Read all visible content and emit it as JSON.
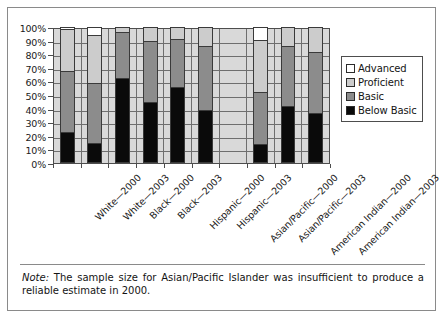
{
  "chart_data": {
    "type": "bar",
    "subtype": "stacked-100-percent",
    "title": "",
    "xlabel": "",
    "ylabel": "",
    "ylim": [
      0,
      100
    ],
    "ytick_labels": [
      "0%",
      "10%",
      "20%",
      "30%",
      "40%",
      "50%",
      "60%",
      "70%",
      "80%",
      "90%",
      "100%"
    ],
    "ytick_values": [
      0,
      10,
      20,
      30,
      40,
      50,
      60,
      70,
      80,
      90,
      100
    ],
    "grid": true,
    "legend_position": "right",
    "categories": [
      "White—2000",
      "White—2003",
      "Black—2000",
      "Black—2003",
      "Hispanic—2000",
      "Hispanic—2003",
      "Asian/Pacific—2000",
      "Asian/Pacific—2003",
      "American Indian—2000",
      "American Indian—2003"
    ],
    "series": [
      {
        "name": "Below Basic",
        "color": "#0a0a0a",
        "values": [
          22,
          14,
          63,
          45,
          56,
          39,
          null,
          13,
          42,
          36
        ]
      },
      {
        "name": "Basic",
        "color": "#8c8c8c",
        "values": [
          46,
          45,
          34,
          45,
          36,
          47,
          null,
          39,
          44,
          46
        ]
      },
      {
        "name": "Proficient",
        "color": "#cccccc",
        "values": [
          31,
          36,
          3,
          10,
          8,
          14,
          null,
          39,
          14,
          18
        ]
      },
      {
        "name": "Advanced",
        "color": "#ffffff",
        "values": [
          1,
          5,
          0,
          0,
          0,
          0,
          null,
          9,
          0,
          0
        ]
      }
    ],
    "missing_categories": [
      "Asian/Pacific—2000"
    ],
    "annotations": []
  },
  "legend": {
    "items": [
      {
        "label": "Advanced",
        "swatch": "advanced-swatch"
      },
      {
        "label": "Proficient",
        "swatch": "proficient-swatch"
      },
      {
        "label": "Basic",
        "swatch": "basic-swatch"
      },
      {
        "label": "Below Basic",
        "swatch": "below-basic-swatch"
      }
    ]
  },
  "note": {
    "lead": "Note:",
    "text": " The sample size for Asian/Pacific Islander was insufficient to produce a reliable estimate in 2000."
  }
}
